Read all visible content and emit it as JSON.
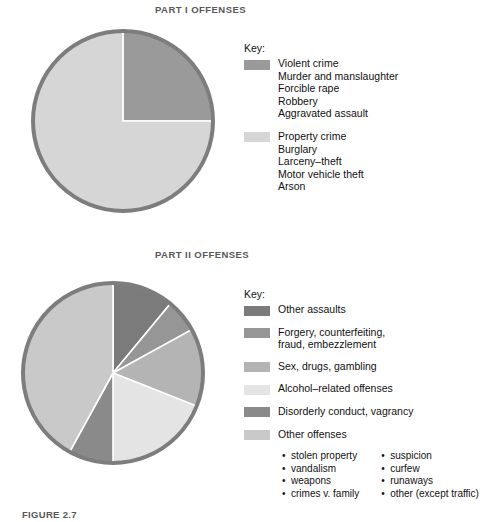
{
  "figure": {
    "part1_title": "PART I OFFENSES",
    "part2_title": "PART II OFFENSES",
    "key_heading": "Key:",
    "caption_number": "FIGURE 2.7",
    "caption_text": "Distribution of total number of争 crime 1999 in the  织"
  },
  "colors": {
    "rim": "#7d7d7d",
    "violent_crime": "#9a9a9a",
    "property_crime": "#d6d6d6",
    "other_assaults": "#7b7b7b",
    "forgery": "#969696",
    "sex_drugs_gambling": "#b4b4b4",
    "alcohol_related": "#e4e4e4",
    "disorderly_conduct": "#8a8a8a",
    "other_offenses": "#c9c9c9",
    "divider": "#ffffff"
  },
  "part1": {
    "key_heading": "Key:",
    "groups": [
      {
        "label": "Violent crime",
        "color_key": "violent_crime",
        "items": [
          "Murder and manslaughter",
          "Forcible rape",
          "Robbery",
          "Aggravated assault"
        ]
      },
      {
        "label": "Property crime",
        "color_key": "property_crime",
        "items": [
          "Burglary",
          "Larceny–theft",
          "Motor vehicle theft",
          "Arson"
        ]
      }
    ]
  },
  "part2": {
    "key_heading": "Key:",
    "entries": [
      {
        "label": "Other assaults",
        "label2": "",
        "color_key": "other_assaults"
      },
      {
        "label": "Forgery, counterfeiting,",
        "label2": "fraud, embezzlement",
        "color_key": "forgery"
      },
      {
        "label": "Sex, drugs, gambling",
        "label2": "",
        "color_key": "sex_drugs_gambling"
      },
      {
        "label": "Alcohol–related offenses",
        "label2": "",
        "color_key": "alcohol_related"
      },
      {
        "label": "Disorderly conduct, vagrancy",
        "label2": "",
        "color_key": "disorderly_conduct"
      },
      {
        "label": "Other offenses",
        "label2": "",
        "color_key": "other_offenses"
      }
    ],
    "bullets_left": [
      "stolen property",
      "vandalism",
      "weapons",
      "crimes v. family"
    ],
    "bullets_right": [
      "suspicion",
      "curfew",
      "runaways",
      "other (except traffic)"
    ]
  },
  "chart_data": [
    {
      "type": "pie",
      "title": "PART I OFFENSES",
      "labels": [
        "Violent crime",
        "Property crime"
      ],
      "values": [
        25,
        75
      ],
      "units": "percent",
      "start_angle_deg": 0,
      "direction": "clockwise",
      "legend": "right",
      "colors": [
        "#9a9a9a",
        "#d6d6d6"
      ]
    },
    {
      "type": "pie",
      "title": "PART II OFFENSES",
      "labels": [
        "Other assaults",
        "Forgery, counterfeiting, fraud, embezzlement",
        "Sex, drugs, gambling",
        "Alcohol–related offenses",
        "Disorderly conduct, vagrancy",
        "Other offenses"
      ],
      "values": [
        11,
        6,
        14,
        19,
        8,
        42
      ],
      "units": "percent",
      "start_angle_deg": 0,
      "direction": "clockwise",
      "legend": "right",
      "colors": [
        "#7b7b7b",
        "#969696",
        "#b4b4b4",
        "#e4e4e4",
        "#8a8a8a",
        "#c9c9c9"
      ]
    }
  ]
}
